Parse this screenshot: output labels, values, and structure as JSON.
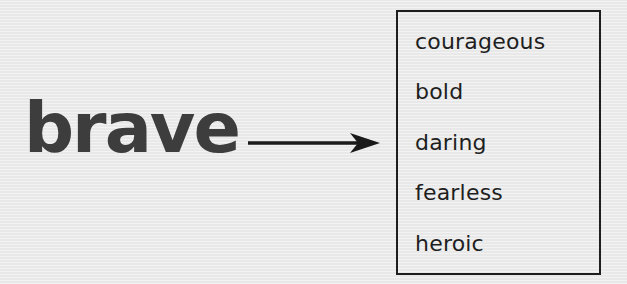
{
  "headword": "brave",
  "arrow": {
    "icon": "right-arrow-icon",
    "color": "#1a1a1a"
  },
  "synonyms_box": {
    "items": [
      {
        "label": "courageous"
      },
      {
        "label": "bold"
      },
      {
        "label": "daring"
      },
      {
        "label": "fearless"
      },
      {
        "label": "heroic"
      }
    ]
  },
  "colors": {
    "background": "#ececec",
    "headword": "#3d3d3d",
    "text": "#1e1e1e",
    "border": "#1e1e1e"
  }
}
